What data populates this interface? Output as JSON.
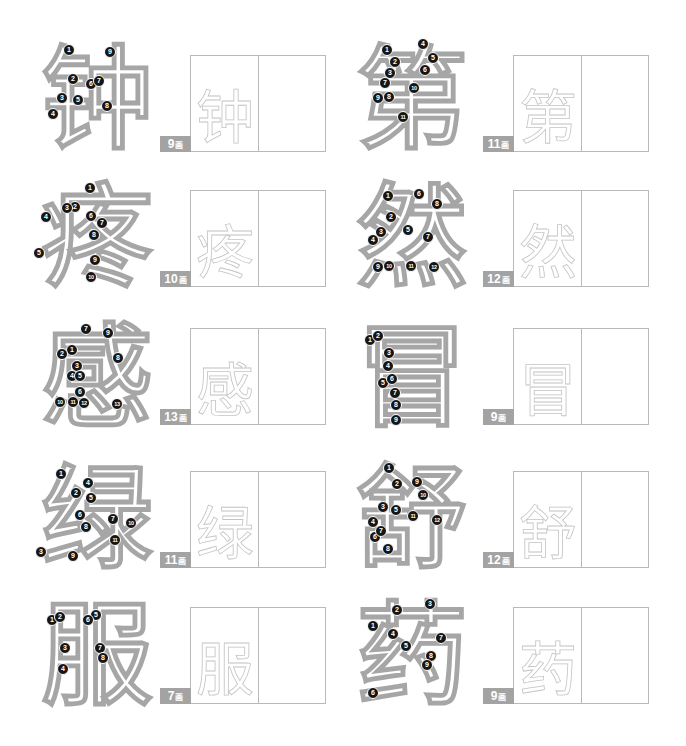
{
  "stroke_unit": "画",
  "cells": [
    {
      "char": "钟",
      "strokes": "9",
      "markers": [
        {
          "n": "1",
          "x": 69,
          "y": 50
        },
        {
          "n": "2",
          "x": 73,
          "y": 79
        },
        {
          "n": "3",
          "x": 62,
          "y": 98
        },
        {
          "n": "4",
          "x": 53,
          "y": 114
        },
        {
          "n": "5",
          "x": 78,
          "y": 100
        },
        {
          "n": "6",
          "x": 91,
          "y": 84
        },
        {
          "n": "7",
          "x": 99,
          "y": 81
        },
        {
          "n": "8",
          "x": 107,
          "y": 106
        },
        {
          "n": "9",
          "x": 110,
          "y": 52
        }
      ]
    },
    {
      "char": "第",
      "strokes": "11",
      "markers": [
        {
          "n": "1",
          "x": 387,
          "y": 50
        },
        {
          "n": "2",
          "x": 395,
          "y": 62
        },
        {
          "n": "3",
          "x": 390,
          "y": 73
        },
        {
          "n": "4",
          "x": 423,
          "y": 44
        },
        {
          "n": "5",
          "x": 433,
          "y": 58
        },
        {
          "n": "6",
          "x": 425,
          "y": 70
        },
        {
          "n": "7",
          "x": 385,
          "y": 83
        },
        {
          "n": "8",
          "x": 389,
          "y": 97
        },
        {
          "n": "9",
          "x": 378,
          "y": 98
        },
        {
          "n": "10",
          "x": 414,
          "y": 88
        },
        {
          "n": "11",
          "x": 403,
          "y": 117
        }
      ]
    },
    {
      "char": "疼",
      "strokes": "10",
      "markers": [
        {
          "n": "1",
          "x": 90,
          "y": 188
        },
        {
          "n": "2",
          "x": 75,
          "y": 207
        },
        {
          "n": "3",
          "x": 67,
          "y": 208
        },
        {
          "n": "4",
          "x": 46,
          "y": 217
        },
        {
          "n": "5",
          "x": 39,
          "y": 253
        },
        {
          "n": "6",
          "x": 91,
          "y": 216
        },
        {
          "n": "7",
          "x": 102,
          "y": 223
        },
        {
          "n": "8",
          "x": 94,
          "y": 235
        },
        {
          "n": "9",
          "x": 95,
          "y": 260
        },
        {
          "n": "10",
          "x": 91,
          "y": 277
        }
      ]
    },
    {
      "char": "然",
      "strokes": "12",
      "markers": [
        {
          "n": "1",
          "x": 388,
          "y": 196
        },
        {
          "n": "2",
          "x": 391,
          "y": 217
        },
        {
          "n": "3",
          "x": 381,
          "y": 232
        },
        {
          "n": "4",
          "x": 373,
          "y": 240
        },
        {
          "n": "5",
          "x": 408,
          "y": 230
        },
        {
          "n": "6",
          "x": 419,
          "y": 194
        },
        {
          "n": "7",
          "x": 428,
          "y": 237
        },
        {
          "n": "8",
          "x": 437,
          "y": 204
        },
        {
          "n": "9",
          "x": 378,
          "y": 267
        },
        {
          "n": "10",
          "x": 389,
          "y": 266
        },
        {
          "n": "11",
          "x": 411,
          "y": 266
        },
        {
          "n": "12",
          "x": 434,
          "y": 267
        }
      ]
    },
    {
      "char": "感",
      "strokes": "13",
      "markers": [
        {
          "n": "1",
          "x": 72,
          "y": 350
        },
        {
          "n": "2",
          "x": 62,
          "y": 354
        },
        {
          "n": "3",
          "x": 77,
          "y": 366
        },
        {
          "n": "4",
          "x": 72,
          "y": 376
        },
        {
          "n": "5",
          "x": 80,
          "y": 376
        },
        {
          "n": "6",
          "x": 80,
          "y": 392
        },
        {
          "n": "7",
          "x": 86,
          "y": 329
        },
        {
          "n": "8",
          "x": 118,
          "y": 358
        },
        {
          "n": "9",
          "x": 108,
          "y": 333
        },
        {
          "n": "10",
          "x": 60,
          "y": 402
        },
        {
          "n": "11",
          "x": 73,
          "y": 402
        },
        {
          "n": "12",
          "x": 84,
          "y": 403
        },
        {
          "n": "13",
          "x": 117,
          "y": 404
        }
      ]
    },
    {
      "char": "冒",
      "strokes": "9",
      "markers": [
        {
          "n": "1",
          "x": 370,
          "y": 340
        },
        {
          "n": "2",
          "x": 378,
          "y": 336
        },
        {
          "n": "3",
          "x": 389,
          "y": 353
        },
        {
          "n": "4",
          "x": 388,
          "y": 366
        },
        {
          "n": "5",
          "x": 383,
          "y": 383
        },
        {
          "n": "6",
          "x": 392,
          "y": 379
        },
        {
          "n": "7",
          "x": 395,
          "y": 393
        },
        {
          "n": "8",
          "x": 396,
          "y": 405
        },
        {
          "n": "9",
          "x": 396,
          "y": 420
        }
      ]
    },
    {
      "char": "绿",
      "strokes": "11",
      "markers": [
        {
          "n": "1",
          "x": 61,
          "y": 474
        },
        {
          "n": "2",
          "x": 76,
          "y": 493
        },
        {
          "n": "3",
          "x": 41,
          "y": 552
        },
        {
          "n": "4",
          "x": 88,
          "y": 483
        },
        {
          "n": "5",
          "x": 91,
          "y": 498
        },
        {
          "n": "6",
          "x": 80,
          "y": 515
        },
        {
          "n": "7",
          "x": 113,
          "y": 519
        },
        {
          "n": "8",
          "x": 86,
          "y": 527
        },
        {
          "n": "9",
          "x": 73,
          "y": 556
        },
        {
          "n": "10",
          "x": 131,
          "y": 523
        },
        {
          "n": "11",
          "x": 115,
          "y": 540
        }
      ]
    },
    {
      "char": "舒",
      "strokes": "12",
      "markers": [
        {
          "n": "1",
          "x": 389,
          "y": 468
        },
        {
          "n": "2",
          "x": 397,
          "y": 484
        },
        {
          "n": "3",
          "x": 383,
          "y": 507
        },
        {
          "n": "4",
          "x": 373,
          "y": 522
        },
        {
          "n": "5",
          "x": 396,
          "y": 510
        },
        {
          "n": "6",
          "x": 375,
          "y": 537
        },
        {
          "n": "7",
          "x": 381,
          "y": 531
        },
        {
          "n": "8",
          "x": 388,
          "y": 549
        },
        {
          "n": "9",
          "x": 417,
          "y": 482
        },
        {
          "n": "10",
          "x": 423,
          "y": 495
        },
        {
          "n": "11",
          "x": 413,
          "y": 516
        },
        {
          "n": "12",
          "x": 437,
          "y": 520
        }
      ]
    },
    {
      "char": "服",
      "strokes": "7",
      "markers": [
        {
          "n": "1",
          "x": 52,
          "y": 620
        },
        {
          "n": "2",
          "x": 60,
          "y": 617
        },
        {
          "n": "3",
          "x": 65,
          "y": 648
        },
        {
          "n": "4",
          "x": 63,
          "y": 669
        },
        {
          "n": "5",
          "x": 96,
          "y": 615
        },
        {
          "n": "6",
          "x": 88,
          "y": 620
        },
        {
          "n": "7",
          "x": 100,
          "y": 648
        },
        {
          "n": "8",
          "x": 103,
          "y": 658
        }
      ]
    },
    {
      "char": "药",
      "strokes": "9",
      "markers": [
        {
          "n": "1",
          "x": 373,
          "y": 626
        },
        {
          "n": "2",
          "x": 397,
          "y": 610
        },
        {
          "n": "3",
          "x": 430,
          "y": 604
        },
        {
          "n": "4",
          "x": 393,
          "y": 634
        },
        {
          "n": "5",
          "x": 406,
          "y": 646
        },
        {
          "n": "6",
          "x": 373,
          "y": 693
        },
        {
          "n": "7",
          "x": 441,
          "y": 638
        },
        {
          "n": "8",
          "x": 431,
          "y": 656
        },
        {
          "n": "9",
          "x": 427,
          "y": 665
        }
      ]
    }
  ]
}
